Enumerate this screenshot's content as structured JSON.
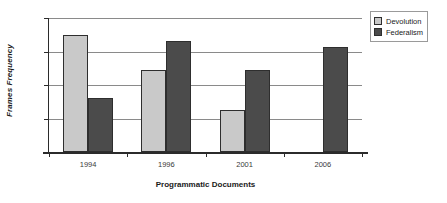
{
  "chart_data": {
    "type": "bar",
    "title": "",
    "xlabel": "Programmatic Documents",
    "ylabel": "Frames Frequency",
    "categories": [
      "1994",
      "1996",
      "2001",
      "2006"
    ],
    "series": [
      {
        "name": "Devolution",
        "color": "#c9c9c9",
        "values": [
          17.5,
          12.3,
          6.2,
          0
        ]
      },
      {
        "name": "Federalism",
        "color": "#4b4b4b",
        "values": [
          8.0,
          16.5,
          12.2,
          15.7
        ]
      }
    ],
    "ylim": [
      0,
      20
    ],
    "yticks": [
      "0",
      "5",
      "10",
      "15",
      "20"
    ],
    "ytick_values": [
      0,
      5,
      10,
      15,
      20
    ],
    "grid": true,
    "legend_position": "top-right"
  },
  "legend": {
    "entries": [
      {
        "label": "Devolution",
        "color": "#c9c9c9"
      },
      {
        "label": "Federalism",
        "color": "#4b4b4b"
      }
    ]
  }
}
